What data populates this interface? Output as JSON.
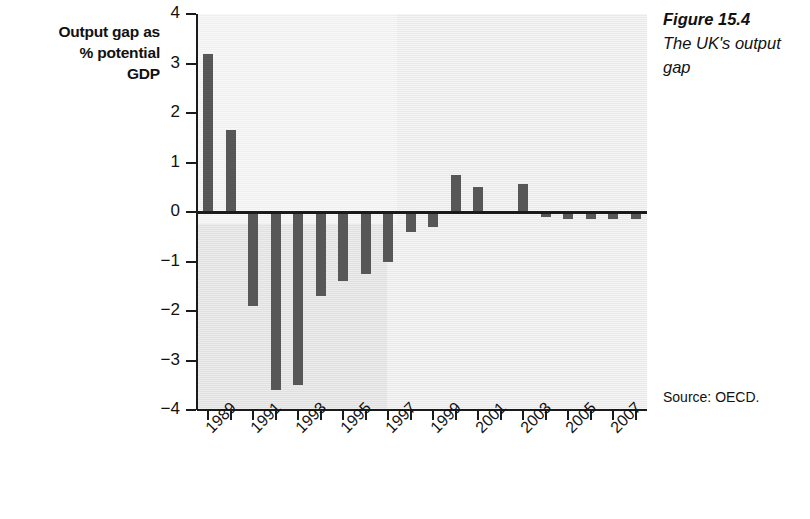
{
  "chart_data": {
    "type": "bar",
    "title": "The UK's output gap",
    "figure_number": "Figure 15.4",
    "source": "Source: OECD.",
    "ylabel": "Output gap as % potential GDP",
    "ylabel_lines": [
      "Output gap as",
      "% potential",
      "GDP"
    ],
    "xlabel": "",
    "ylim": [
      -4,
      4
    ],
    "ytick_labels": [
      "4",
      "3",
      "2",
      "1",
      "0",
      "−1",
      "−2",
      "−3",
      "−4"
    ],
    "ytick_values": [
      4,
      3,
      2,
      1,
      0,
      -1,
      -2,
      -3,
      -4
    ],
    "grid": false,
    "legend": "none",
    "categories": [
      "1989",
      "1990",
      "1991",
      "1992",
      "1993",
      "1994",
      "1995",
      "1996",
      "1997",
      "1998",
      "1999",
      "2000",
      "2001",
      "2002",
      "2003",
      "2004",
      "2005",
      "2006",
      "2007",
      "2008"
    ],
    "xtick_labels_shown": [
      "1989",
      "1991",
      "1993",
      "1995",
      "1997",
      "1999",
      "2001",
      "2003",
      "2005",
      "2007"
    ],
    "values": [
      3.2,
      1.65,
      -1.9,
      -3.6,
      -3.5,
      -1.7,
      -1.4,
      -1.25,
      -1.0,
      -0.4,
      -0.3,
      0.75,
      0.5,
      -0.05,
      0.57,
      -0.1,
      -0.15,
      -0.15,
      -0.15,
      -0.15
    ],
    "bar_color": "#575757",
    "plot_background": "#e9e9e9",
    "axis_color": "#1a1a1a"
  }
}
